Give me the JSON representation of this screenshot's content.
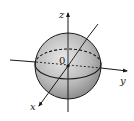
{
  "diagram": {
    "type": "sphere-in-3d-axes",
    "labels": {
      "z_axis": "z",
      "y_axis": "y",
      "x_axis": "x",
      "origin": "0"
    },
    "colors": {
      "sphere_fill_light": "#e6e6e6",
      "sphere_fill_dark": "#8a8a8a",
      "stroke": "#1a1a1a"
    }
  }
}
